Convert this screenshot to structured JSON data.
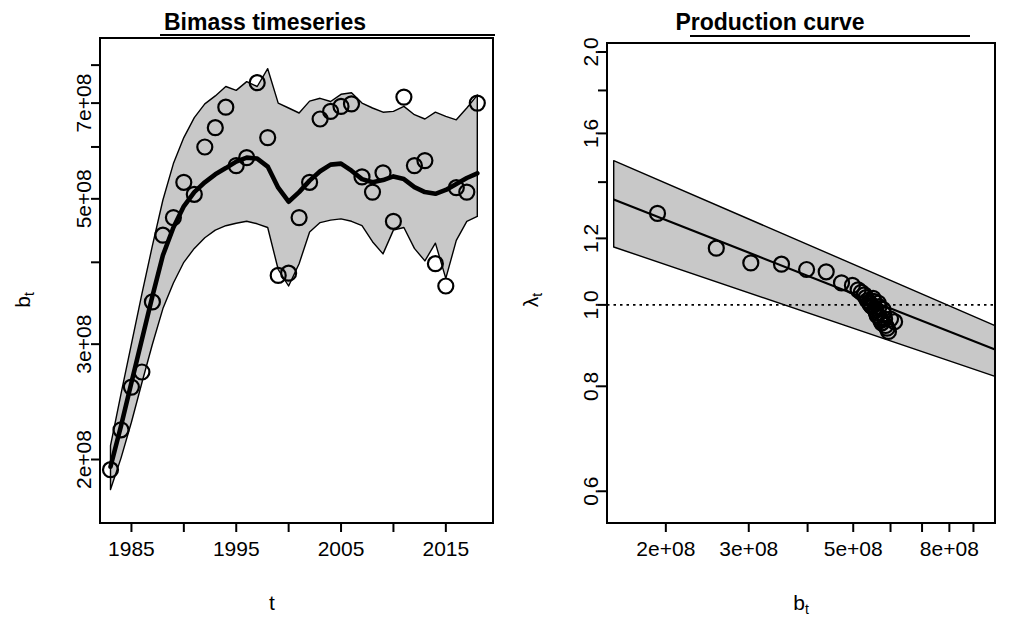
{
  "figure": {
    "width": 1029,
    "height": 636,
    "background": "#ffffff",
    "ribbon_color": "#c8c8c8",
    "line_color": "#000000"
  },
  "chart_data": [
    {
      "id": "biomass-timeseries",
      "type": "line",
      "title": "Bimass timeseries",
      "xlabel": "t",
      "ylabel": "b_t",
      "ylabel_display": "bt",
      "x_scale": "linear",
      "y_scale": "log",
      "xlim": [
        1982,
        2019.5
      ],
      "ylim": [
        160000000,
        880000000
      ],
      "grid": false,
      "legend": "none",
      "x_ticks": [
        1985,
        1990,
        1995,
        2000,
        2005,
        2010,
        2015
      ],
      "x_tick_labels": [
        "1985",
        "",
        "1995",
        "",
        "2005",
        "",
        "2015"
      ],
      "y_ticks": [
        200000000,
        300000000,
        400000000,
        500000000,
        600000000,
        700000000,
        800000000
      ],
      "y_tick_labels": [
        "2e+08",
        "3e+08",
        "",
        "5e+08",
        "",
        "7e+08",
        ""
      ],
      "series": [
        {
          "name": "median",
          "style": "thick-line",
          "x": [
            1983,
            1984,
            1985,
            1986,
            1987,
            1988,
            1989,
            1990,
            1991,
            1992,
            1993,
            1994,
            1995,
            1996,
            1997,
            1998,
            1999,
            2000,
            2001,
            2002,
            2003,
            2004,
            2005,
            2006,
            2007,
            2008,
            2009,
            2010,
            2011,
            2012,
            2013,
            2014,
            2015,
            2016,
            2017,
            2018
          ],
          "values": [
            195000000,
            225000000,
            262000000,
            305000000,
            355000000,
            410000000,
            452000000,
            487000000,
            512000000,
            530000000,
            545000000,
            557000000,
            570000000,
            578000000,
            576000000,
            560000000,
            520000000,
            495000000,
            512000000,
            533000000,
            551000000,
            564000000,
            566000000,
            552000000,
            536000000,
            530000000,
            534000000,
            541000000,
            536000000,
            521000000,
            512000000,
            509000000,
            516000000,
            527000000,
            538000000,
            547000000
          ]
        },
        {
          "name": "credible-interval-upper",
          "style": "ribbon-edge",
          "x": [
            1983,
            1984,
            1985,
            1986,
            1987,
            1988,
            1989,
            1990,
            1991,
            1992,
            1993,
            1994,
            1995,
            1996,
            1997,
            1998,
            1999,
            2000,
            2001,
            2002,
            2003,
            2004,
            2005,
            2006,
            2007,
            2008,
            2009,
            2010,
            2011,
            2012,
            2013,
            2014,
            2015,
            2016,
            2017,
            2018
          ],
          "values": [
            210000000,
            252000000,
            300000000,
            358000000,
            424000000,
            498000000,
            566000000,
            620000000,
            665000000,
            698000000,
            718000000,
            742000000,
            732000000,
            755000000,
            742000000,
            790000000,
            700000000,
            688000000,
            676000000,
            705000000,
            712000000,
            704000000,
            722000000,
            726000000,
            700000000,
            688000000,
            678000000,
            680000000,
            692000000,
            672000000,
            662000000,
            678000000,
            668000000,
            660000000,
            688000000,
            720000000
          ]
        },
        {
          "name": "credible-interval-lower",
          "style": "ribbon-edge",
          "x": [
            1983,
            1984,
            1985,
            1986,
            1987,
            1988,
            1989,
            1990,
            1991,
            1992,
            1993,
            1994,
            1995,
            1996,
            1997,
            1998,
            1999,
            2000,
            2001,
            2002,
            2003,
            2004,
            2005,
            2006,
            2007,
            2008,
            2009,
            2010,
            2011,
            2012,
            2013,
            2014,
            2015,
            2016,
            2017,
            2018
          ],
          "values": [
            180000000,
            201000000,
            228000000,
            262000000,
            300000000,
            340000000,
            372000000,
            400000000,
            420000000,
            436000000,
            448000000,
            455000000,
            459000000,
            462000000,
            458000000,
            452000000,
            390000000,
            368000000,
            398000000,
            445000000,
            460000000,
            464000000,
            466000000,
            462000000,
            455000000,
            430000000,
            412000000,
            448000000,
            452000000,
            420000000,
            402000000,
            428000000,
            378000000,
            432000000,
            462000000,
            470000000
          ]
        },
        {
          "name": "observations",
          "style": "open-circles",
          "x": [
            1983,
            1984,
            1985,
            1986,
            1987,
            1988,
            1989,
            1990,
            1991,
            1992,
            1993,
            1994,
            1995,
            1996,
            1997,
            1998,
            1999,
            2000,
            2001,
            2002,
            2003,
            2004,
            2005,
            2006,
            2007,
            2008,
            2009,
            2010,
            2011,
            2012,
            2013,
            2014,
            2015,
            2016,
            2017,
            2018
          ],
          "values": [
            193000000,
            222000000,
            258000000,
            272000000,
            348000000,
            440000000,
            468000000,
            530000000,
            508000000,
            600000000,
            642000000,
            690000000,
            562000000,
            578000000,
            752000000,
            620000000,
            382000000,
            385000000,
            468000000,
            530000000,
            662000000,
            680000000,
            692000000,
            698000000,
            540000000,
            512000000,
            548000000,
            462000000,
            715000000,
            562000000,
            572000000,
            398000000,
            368000000,
            520000000,
            512000000,
            700000000
          ]
        }
      ]
    },
    {
      "id": "production-curve",
      "type": "scatter",
      "title": "Production curve",
      "xlabel": "b_t",
      "xlabel_display": "bt",
      "ylabel": "lambda_t",
      "ylabel_display": "λt",
      "x_scale": "log",
      "y_scale": "log",
      "xlim": [
        150000000,
        1000000000
      ],
      "ylim": [
        0.55,
        2.05
      ],
      "grid": false,
      "legend": "none",
      "reference_line": {
        "y": 1.0,
        "style": "dotted"
      },
      "x_ticks": [
        200000000,
        300000000,
        400000000,
        500000000,
        600000000,
        700000000,
        800000000,
        900000000
      ],
      "x_tick_labels": [
        "2e+08",
        "3e+08",
        "",
        "5e+08",
        "",
        "",
        "8e+08",
        ""
      ],
      "y_ticks": [
        0.6,
        0.8,
        1.0,
        1.2,
        1.4,
        1.6,
        1.8,
        2.0
      ],
      "y_tick_labels": [
        "0.6",
        "0.8",
        "1.0",
        "1.2",
        "1.4",
        "1.6",
        "1.8",
        "2.0"
      ],
      "fit": {
        "name": "production-fit",
        "x": [
          155000000,
          1000000000
        ],
        "values": [
          1.335,
          0.885
        ]
      },
      "band": {
        "name": "credible-interval",
        "x": [
          155000000,
          1000000000
        ],
        "upper": [
          1.485,
          0.945
        ],
        "lower": [
          1.172,
          0.822
        ]
      },
      "points": {
        "name": "observations",
        "x": [
          192000000,
          256000000,
          303000000,
          352000000,
          398000000,
          438000000,
          472000000,
          498000000,
          512000000,
          520000000,
          528000000,
          532000000,
          536000000,
          540000000,
          543000000,
          546000000,
          548000000,
          551000000,
          553000000,
          556000000,
          558000000,
          560000000,
          562000000,
          565000000,
          567000000,
          570000000,
          572000000,
          575000000,
          578000000,
          580000000,
          583000000,
          586000000,
          590000000,
          594000000,
          600000000,
          612000000
        ],
        "values": [
          1.285,
          1.168,
          1.122,
          1.118,
          1.102,
          1.095,
          1.062,
          1.055,
          1.042,
          1.035,
          1.028,
          1.02,
          1.012,
          1.008,
          1.002,
          0.998,
          0.996,
          1.018,
          1.01,
          0.992,
          0.985,
          0.978,
          0.972,
          1.005,
          0.995,
          0.965,
          0.958,
          0.952,
          0.988,
          0.975,
          0.962,
          0.945,
          0.938,
          0.93,
          0.962,
          0.955
        ]
      }
    }
  ]
}
